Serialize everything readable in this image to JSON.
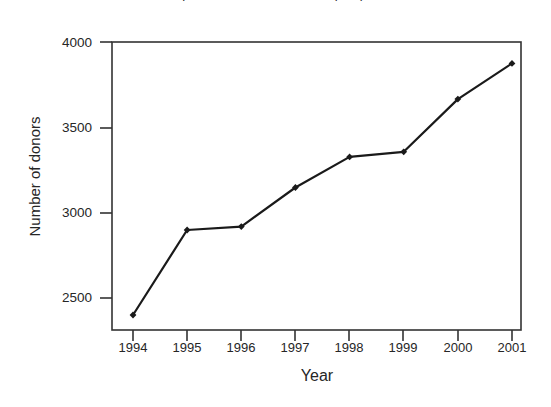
{
  "chart_data": {
    "type": "line",
    "title": "Figure 1. Number of donors per year",
    "xlabel": "Year",
    "ylabel": "Number of donors",
    "categories": [
      "1994",
      "1995",
      "1996",
      "1997",
      "1998",
      "1999",
      "2000",
      "2001"
    ],
    "x": [
      1994,
      1995,
      1996,
      1997,
      1998,
      1999,
      2000,
      2001
    ],
    "values": [
      2400,
      2900,
      2920,
      3150,
      3330,
      3360,
      3670,
      3880
    ],
    "series": [
      {
        "name": "Number of donors",
        "values": [
          2400,
          2900,
          2920,
          3150,
          3330,
          3360,
          3670,
          3880
        ]
      }
    ],
    "ylim": [
      2310,
      4000
    ],
    "yticks": [
      2500,
      3000,
      3500,
      4000
    ],
    "ytick_labels": [
      "2500",
      "3000",
      "3500",
      "4000"
    ],
    "xtick_labels": [
      "1994",
      "1995",
      "1996",
      "1997",
      "1998",
      "1999",
      "2000",
      "2001"
    ],
    "grid": false,
    "legend": false,
    "legend_position": "none",
    "line_color": "#1a1a1a",
    "marker": "diamond",
    "marker_color": "#1a1a1a",
    "axis_color": "#333333",
    "background_color": "#ffffff"
  },
  "axes": {
    "frame": {
      "left": 112,
      "top": 42,
      "right": 521,
      "bottom": 330
    }
  }
}
